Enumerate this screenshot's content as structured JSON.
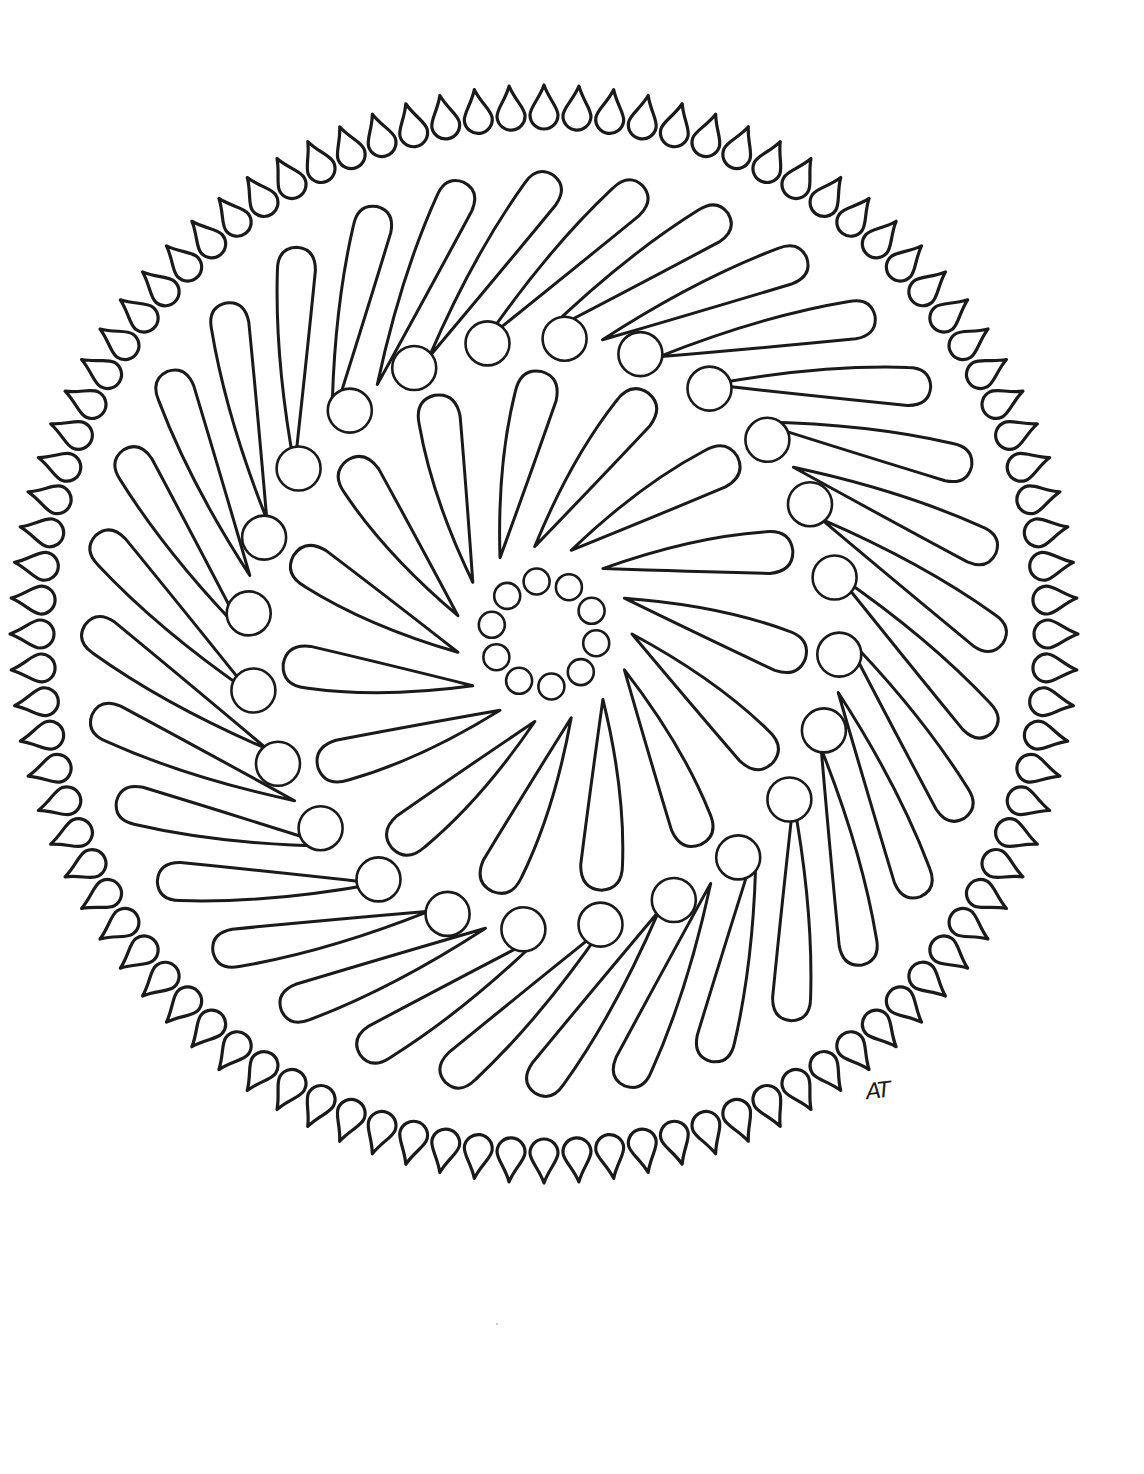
{
  "page": {
    "background": "#ffffff",
    "ink_color": "#1a1a1a"
  },
  "mandala": {
    "center": {
      "x": 544,
      "y": 634
    },
    "rings": [
      {
        "name": "outer-drop-ring",
        "type": "drop",
        "count": 96,
        "radius_x": 512,
        "radius_y": 527,
        "length": 44,
        "width": 28,
        "orientation": "tip-inward",
        "stroke_width": 3.2
      },
      {
        "name": "outer-paisley-ring",
        "type": "paisley",
        "count": 32,
        "tip_radius": 300,
        "bulb_radius": 440,
        "swirl_degrees": 22,
        "bulb_width": 40,
        "stroke_width": 3
      },
      {
        "name": "middle-circle-ring",
        "type": "circle",
        "count": 24,
        "radius": 296,
        "circle_radius": 22,
        "rotation_offset": 4,
        "stroke_width": 2.6
      },
      {
        "name": "inner-paisley-ring",
        "type": "paisley",
        "count": 15,
        "tip_radius": 88,
        "bulb_radius": 238,
        "swirl_degrees": 28,
        "bulb_width": 44,
        "stroke_width": 3
      },
      {
        "name": "inner-circle-ring",
        "type": "circle",
        "count": 10,
        "radius": 53,
        "circle_radius": 13,
        "rotation_offset": 10,
        "stroke_width": 2.6
      }
    ]
  },
  "signature": {
    "text": "AT",
    "x": 866,
    "y": 1078
  },
  "speck": {
    "x": 496,
    "y": 1323
  }
}
